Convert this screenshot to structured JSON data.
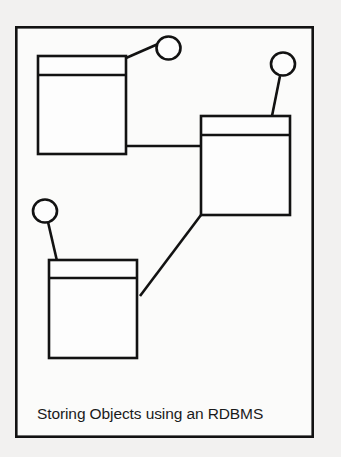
{
  "diagram": {
    "caption": "Storing Objects using an RDBMS",
    "background_color": "#f2f1f0",
    "stroke_color": "#121212",
    "fill_color": "#fdfdfd",
    "frame": {
      "label": "diagram-frame",
      "x": 15,
      "y": 26,
      "width": 299,
      "height": 412,
      "stroke_width": 2.6
    },
    "boxes": [
      {
        "id": "box-top-left",
        "label": "table-box-top-left",
        "x": 38,
        "y": 56,
        "width": 88,
        "height": 98,
        "header_height": 19,
        "stroke_width": 2.6
      },
      {
        "id": "box-right",
        "label": "table-box-right",
        "x": 201,
        "y": 116,
        "width": 89,
        "height": 99,
        "header_height": 19,
        "stroke_width": 2.6
      },
      {
        "id": "box-bottom-left",
        "label": "table-box-bottom-left",
        "x": 49,
        "y": 260,
        "width": 88,
        "height": 98,
        "header_height": 18,
        "stroke_width": 2.6
      }
    ],
    "circles": [
      {
        "id": "circle-top",
        "label": "object-node-top",
        "cx": 168.5,
        "cy": 48,
        "rx": 12,
        "ry": 11.5,
        "stroke_width": 2.6
      },
      {
        "id": "circle-right",
        "label": "object-node-right",
        "cx": 283,
        "cy": 64,
        "rx": 12,
        "ry": 11.5,
        "stroke_width": 2.6
      },
      {
        "id": "circle-left",
        "label": "object-node-left",
        "cx": 45,
        "cy": 212,
        "rx": 12,
        "ry": 11.5,
        "stroke_width": 2.6
      }
    ],
    "connectors": [
      {
        "id": "connector-topbox-to-circle-top",
        "label": "connector-line-topbox-circle",
        "x1": 126,
        "y1": 58,
        "x2": 157.5,
        "y2": 44,
        "stroke_width": 2.6
      },
      {
        "id": "connector-circle-right-to-rightbox",
        "label": "connector-line-circle-rightbox",
        "x1": 280,
        "y1": 76,
        "x2": 272,
        "y2": 116,
        "stroke_width": 2.6
      },
      {
        "id": "connector-circle-left-to-bottombox",
        "label": "connector-line-circle-bottombox",
        "x1": 48,
        "y1": 223,
        "x2": 57,
        "y2": 260,
        "stroke_width": 2.6
      },
      {
        "id": "connector-topbox-to-rightbox",
        "label": "connector-line-topbox-rightbox",
        "x1": 126,
        "y1": 146,
        "x2": 201,
        "y2": 146,
        "stroke_width": 2.6
      },
      {
        "id": "connector-bottombox-to-rightbox",
        "label": "connector-line-bottombox-rightbox",
        "x1": 140,
        "y1": 296,
        "x2": 201,
        "y2": 215,
        "stroke_width": 2.6
      }
    ],
    "caption_position": {
      "x": 37,
      "y": 419
    }
  }
}
